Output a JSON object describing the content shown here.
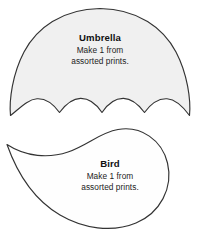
{
  "page": {
    "background_color": "#ffffff",
    "outline_color": "#2b2b2b",
    "text_color": "#1a1a1a"
  },
  "shapes": [
    {
      "id": "umbrella",
      "name": "umbrella-pattern-piece",
      "fill_color": "#f0f0f0",
      "stroke_color": "#333333",
      "title": "Umbrella",
      "instruction_line_1": "Make 1 from",
      "instruction_line_2": "assorted prints.",
      "scallop_count": 4
    },
    {
      "id": "bird",
      "name": "bird-pattern-piece",
      "fill_color": "#fefefe",
      "stroke_color": "#333333",
      "title": "Bird",
      "instruction_line_1": "Make 1 from",
      "instruction_line_2": "assorted prints."
    }
  ],
  "umbrella": {
    "title": "Umbrella",
    "line1": "Make 1 from",
    "line2": "assorted prints."
  },
  "bird": {
    "title": "Bird",
    "line1": "Make 1 from",
    "line2": "assorted prints."
  }
}
